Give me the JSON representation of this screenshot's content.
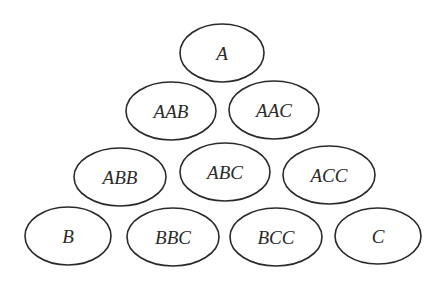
{
  "diagram": {
    "type": "triangular-arrangement",
    "nodes": [
      {
        "label": "A",
        "cx": 222,
        "cy": 53,
        "rx": 42,
        "ry": 29
      },
      {
        "label": "AAB",
        "cx": 171,
        "cy": 111,
        "rx": 45,
        "ry": 29
      },
      {
        "label": "AAC",
        "cx": 274,
        "cy": 110,
        "rx": 45,
        "ry": 29
      },
      {
        "label": "ABB",
        "cx": 120,
        "cy": 177,
        "rx": 46,
        "ry": 29
      },
      {
        "label": "ABC",
        "cx": 225,
        "cy": 172,
        "rx": 45,
        "ry": 29
      },
      {
        "label": "ACC",
        "cx": 329,
        "cy": 175,
        "rx": 46,
        "ry": 29
      },
      {
        "label": "B",
        "cx": 68,
        "cy": 236,
        "rx": 43,
        "ry": 29
      },
      {
        "label": "BBC",
        "cx": 173,
        "cy": 237,
        "rx": 46,
        "ry": 29
      },
      {
        "label": "BCC",
        "cx": 276,
        "cy": 237,
        "rx": 46,
        "ry": 29
      },
      {
        "label": "C",
        "cx": 378,
        "cy": 236,
        "rx": 43,
        "ry": 28
      }
    ]
  }
}
